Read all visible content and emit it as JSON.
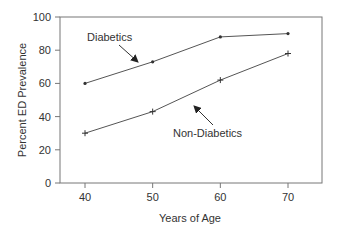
{
  "chart_data": {
    "type": "line",
    "title": "",
    "xlabel": "Years of Age",
    "ylabel": "Percent ED Prevalence",
    "x": [
      40,
      50,
      60,
      70
    ],
    "xticks": [
      "40",
      "50",
      "60",
      "70"
    ],
    "yticks": [
      "0",
      "20",
      "40",
      "60",
      "80",
      "100"
    ],
    "xlim": [
      36.3,
      75
    ],
    "ylim": [
      0,
      100
    ],
    "grid": false,
    "legend": "annotations",
    "series": [
      {
        "name": "Diabetics",
        "values": [
          60,
          73,
          88,
          90
        ],
        "marker": "dot"
      },
      {
        "name": "Non-Diabetics",
        "values": [
          30,
          43,
          62,
          78
        ],
        "marker": "plus"
      }
    ],
    "annotations": [
      {
        "text": "Diabetics",
        "points_to": "Diabetics line near age 49"
      },
      {
        "text": "Non-Diabetics",
        "points_to": "Non-Diabetics line near age 56"
      }
    ]
  },
  "colors": {
    "line": "#555555",
    "axis": "#777777",
    "text": "#333333"
  }
}
